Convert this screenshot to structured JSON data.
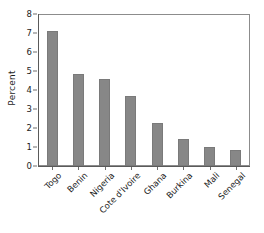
{
  "chart_data": {
    "type": "bar",
    "title": "",
    "xlabel": "",
    "ylabel": "Percent",
    "ylim": [
      0,
      8
    ],
    "yticks": [
      0,
      1,
      2,
      3,
      4,
      5,
      6,
      7,
      8
    ],
    "ytick_labels": [
      "0",
      "1",
      "2",
      "3",
      "4",
      "5",
      "6",
      "7",
      "8"
    ],
    "grid": false,
    "legend": "none",
    "bar_color": "#878787",
    "axis_color": "#5a5a5a",
    "categories": [
      "Togo",
      "Benin",
      "Nigeria",
      "Cote d'Ivoire",
      "Ghana",
      "Burkina",
      "Mali",
      "Senegal"
    ],
    "values": [
      7.1,
      4.85,
      4.6,
      3.68,
      2.25,
      1.4,
      1.0,
      0.85
    ]
  }
}
